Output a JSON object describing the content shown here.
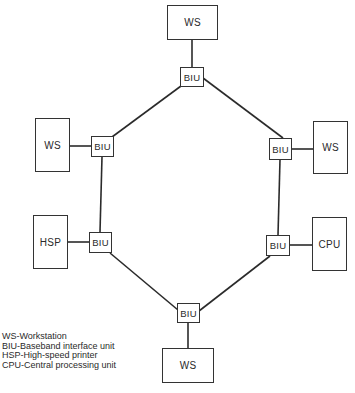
{
  "diagram": {
    "type": "ring network topology",
    "nodes": {
      "ws_top": {
        "label": "WS"
      },
      "biu_top": {
        "label": "BIU"
      },
      "ws_left": {
        "label": "WS"
      },
      "biu_left_upper": {
        "label": "BIU"
      },
      "hsp": {
        "label": "HSP"
      },
      "biu_left_lower": {
        "label": "BIU"
      },
      "ws_right": {
        "label": "WS"
      },
      "biu_right_upper": {
        "label": "BIU"
      },
      "cpu": {
        "label": "CPU"
      },
      "biu_right_lower": {
        "label": "BIU"
      },
      "biu_bottom": {
        "label": "BIU"
      },
      "ws_bottom": {
        "label": "WS"
      }
    },
    "edges": [
      [
        "ws_top",
        "biu_top"
      ],
      [
        "ws_left",
        "biu_left_upper"
      ],
      [
        "hsp",
        "biu_left_lower"
      ],
      [
        "ws_right",
        "biu_right_upper"
      ],
      [
        "cpu",
        "biu_right_lower"
      ],
      [
        "ws_bottom",
        "biu_bottom"
      ],
      [
        "biu_top",
        "biu_left_upper"
      ],
      [
        "biu_left_upper",
        "biu_left_lower"
      ],
      [
        "biu_left_lower",
        "biu_bottom"
      ],
      [
        "biu_bottom",
        "biu_right_lower"
      ],
      [
        "biu_right_lower",
        "biu_right_upper"
      ],
      [
        "biu_right_upper",
        "biu_top"
      ]
    ]
  },
  "legend": {
    "items": [
      "WS-Workstation",
      "BIU-Baseband interface unit",
      "HSP-High-speed printer",
      "CPU-Central processing unit"
    ]
  }
}
